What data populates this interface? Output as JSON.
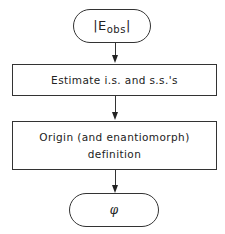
{
  "diagram": {
    "type": "flowchart",
    "nodes": [
      {
        "id": "start",
        "shape": "terminator",
        "label_prefix": "|E",
        "label_sub": "obs",
        "label_suffix": "|",
        "full_label": "|E_obs|"
      },
      {
        "id": "step1",
        "shape": "process",
        "label": "Estimate i.s. and s.s.'s"
      },
      {
        "id": "step2",
        "shape": "process",
        "label_line1": "Origin (and enantiomorph)",
        "label_line2": "definition"
      },
      {
        "id": "end",
        "shape": "terminator",
        "label": "φ"
      }
    ],
    "edges": [
      {
        "from": "start",
        "to": "step1"
      },
      {
        "from": "step1",
        "to": "step2"
      },
      {
        "from": "step2",
        "to": "end"
      }
    ]
  }
}
